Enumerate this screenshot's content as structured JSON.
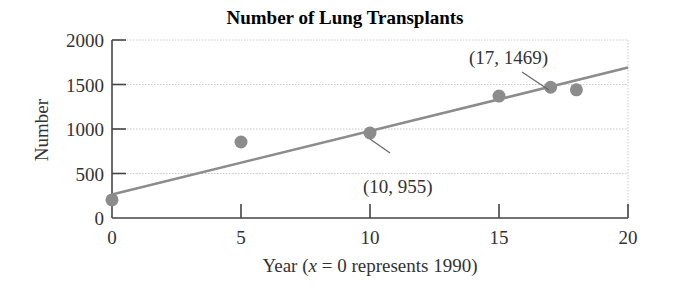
{
  "chart_data": {
    "type": "scatter",
    "title": "Number of Lung Transplants",
    "xlabel": "Year (x = 0 represents 1990)",
    "xlabel_parts": {
      "prefix": "Year (",
      "var": "x",
      "suffix": " = 0 represents 1990)"
    },
    "ylabel": "Number",
    "xlim": [
      0,
      20
    ],
    "ylim": [
      0,
      2000
    ],
    "xticks": [
      0,
      5,
      10,
      15,
      20
    ],
    "yticks": [
      0,
      500,
      1000,
      1500,
      2000
    ],
    "grid": {
      "horizontal": true,
      "style": "dotted"
    },
    "series": [
      {
        "name": "Lung transplants",
        "marker": "circle",
        "color": "#8c8c8c",
        "points": [
          {
            "x": 0,
            "y": 203
          },
          {
            "x": 5,
            "y": 854
          },
          {
            "x": 10,
            "y": 955
          },
          {
            "x": 15,
            "y": 1370
          },
          {
            "x": 17,
            "y": 1469
          },
          {
            "x": 18,
            "y": 1440
          }
        ]
      }
    ],
    "trendline": {
      "name": "Linear model",
      "color": "#8c8c8c",
      "from": {
        "x": 0,
        "y": 265
      },
      "to": {
        "x": 20,
        "y": 1690
      }
    },
    "annotations": [
      {
        "text": "(17, 1469)",
        "point": {
          "x": 17,
          "y": 1469
        },
        "label_x": 469,
        "label_y": 64,
        "leader_from": [
          522,
          72
        ],
        "leader_to": [
          549,
          90
        ]
      },
      {
        "text": "(10, 955)",
        "point": {
          "x": 10,
          "y": 955
        },
        "label_x": 363,
        "label_y": 193,
        "leader_from": [
          370,
          139
        ],
        "leader_to": [
          390,
          153
        ]
      }
    ]
  },
  "colors": {
    "axis": "#444444",
    "grid": "#c8c8c8",
    "marker": "#8c8c8c",
    "line": "#8c8c8c"
  }
}
